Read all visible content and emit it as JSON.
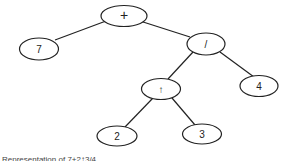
{
  "diagram": {
    "type": "expression-tree",
    "nodes": [
      {
        "id": "plus",
        "label": "+",
        "cx": 124,
        "cy": 16,
        "rx": 23,
        "ry": 10.5
      },
      {
        "id": "seven",
        "label": "7",
        "cx": 39,
        "cy": 49,
        "rx": 19.5,
        "ry": 11
      },
      {
        "id": "div",
        "label": "/",
        "cx": 206,
        "cy": 44,
        "rx": 19,
        "ry": 11
      },
      {
        "id": "pow",
        "label": "↑",
        "cx": 161,
        "cy": 89,
        "rx": 19.5,
        "ry": 10.5
      },
      {
        "id": "four",
        "label": "4",
        "cx": 259,
        "cy": 86,
        "rx": 19,
        "ry": 10.5
      },
      {
        "id": "two",
        "label": "2",
        "cx": 117,
        "cy": 136,
        "rx": 20,
        "ry": 10
      },
      {
        "id": "three",
        "label": "3",
        "cx": 202,
        "cy": 134,
        "rx": 19.5,
        "ry": 10
      }
    ],
    "edges": [
      {
        "from": "plus",
        "to": "seven",
        "x1": 106,
        "y1": 21,
        "x2": 55,
        "y2": 40
      },
      {
        "from": "plus",
        "to": "div",
        "x1": 140,
        "y1": 21,
        "x2": 190,
        "y2": 37
      },
      {
        "from": "div",
        "to": "pow",
        "x1": 193,
        "y1": 52,
        "x2": 168,
        "y2": 79
      },
      {
        "from": "div",
        "to": "four",
        "x1": 220,
        "y1": 52,
        "x2": 254,
        "y2": 77
      },
      {
        "from": "pow",
        "to": "two",
        "x1": 153,
        "y1": 98,
        "x2": 125,
        "y2": 127
      },
      {
        "from": "pow",
        "to": "three",
        "x1": 172,
        "y1": 98,
        "x2": 195,
        "y2": 125
      }
    ]
  },
  "caption": "Representation of 7+2↑3/4"
}
